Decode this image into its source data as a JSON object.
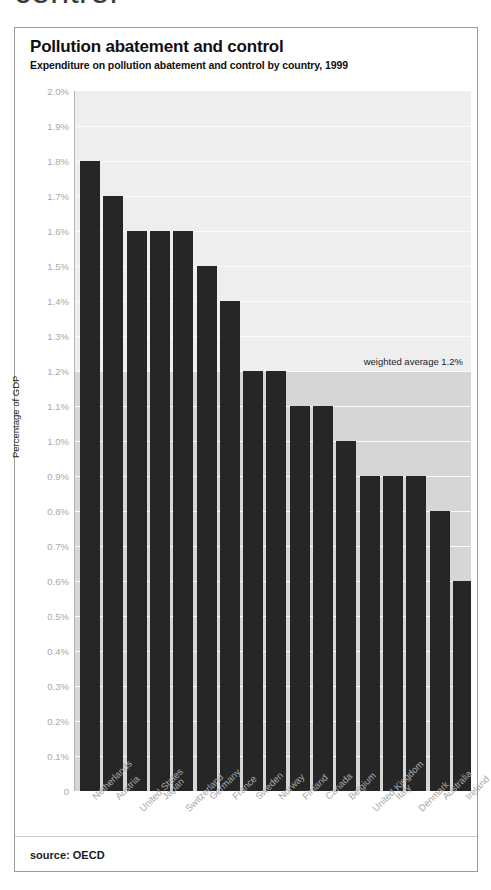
{
  "page": {
    "clipped_heading_above": "control"
  },
  "card": {
    "title": "Pollution abatement and control",
    "subtitle": "Expenditure on pollution abatement and control by country, 1999",
    "source": "source: OECD"
  },
  "chart_data": {
    "type": "bar",
    "title": "Pollution abatement and control",
    "subtitle": "Expenditure on pollution abatement and control by country, 1999",
    "xlabel": "",
    "ylabel": "Percentage of GDP",
    "ylim": [
      0,
      2.0
    ],
    "ytick_step": 0.1,
    "ytick_labels": [
      "2.0%",
      "1.9%",
      "1.8%",
      "1.7%",
      "1.6%",
      "1.5%",
      "1.4%",
      "1.3%",
      "1.2%",
      "1.1%",
      "1.0%",
      "0.9%",
      "0.8%",
      "0.7%",
      "0.6%",
      "0.5%",
      "0.4%",
      "0.3%",
      "0.2%",
      "0.1%",
      "0"
    ],
    "grid": true,
    "legend": "none",
    "bar_color": "#262626",
    "plot_bg_above_average": "#eeeeee",
    "plot_bg_below_average": "#d6d6d6",
    "annotation": {
      "text": "weighted average 1.2%",
      "value": 1.2
    },
    "source": "source: OECD",
    "categories": [
      "Netherlands",
      "Austria",
      "United States",
      "Japan",
      "Switzerland",
      "Germany",
      "France",
      "Sweden",
      "Norway",
      "Finland",
      "Canada",
      "Belgium",
      "United Kingdom",
      "Italy",
      "Denmark",
      "Australia",
      "Ireland"
    ],
    "values": [
      1.8,
      1.7,
      1.6,
      1.6,
      1.6,
      1.5,
      1.4,
      1.2,
      1.2,
      1.1,
      1.1,
      1.0,
      0.9,
      0.9,
      0.9,
      0.8,
      0.6
    ]
  }
}
